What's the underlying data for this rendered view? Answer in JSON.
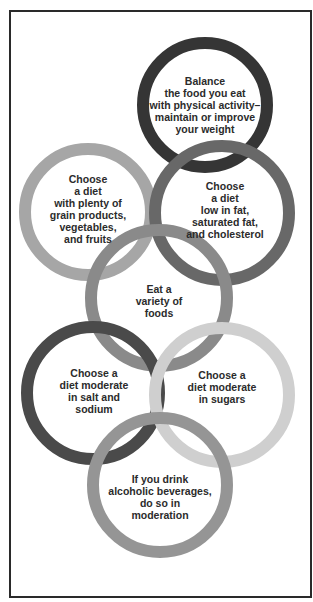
{
  "diagram": {
    "type": "interlocking-rings",
    "frame_color": "#2a2a2a",
    "rings": [
      {
        "id": "balance",
        "text": "Balance\nthe food you eat\nwith physical activity–\nmaintain or improve\nyour weight",
        "color": "#353535",
        "cx": 205,
        "cy": 105,
        "r": 62
      },
      {
        "id": "grain",
        "text": "Choose\na diet\nwith plenty of\ngrain products,\nvegetables,\nand fruits",
        "color": "#a6a6a6",
        "cx": 88,
        "cy": 212,
        "r": 63
      },
      {
        "id": "fat",
        "text": "Choose\na diet\nlow in fat,\nsaturated fat,\nand cholesterol",
        "color": "#686868",
        "cx": 222,
        "cy": 213,
        "r": 67
      },
      {
        "id": "variety",
        "text": "Eat a\nvariety of\nfoods",
        "color": "#8a8a8a",
        "cx": 159,
        "cy": 298,
        "r": 68
      },
      {
        "id": "salt",
        "text": "Choose a\ndiet moderate\nin salt and\nsodium",
        "color": "#4a4a4a",
        "cx": 93,
        "cy": 393,
        "r": 66
      },
      {
        "id": "sugars",
        "text": "Choose a\ndiet moderate\nin sugars",
        "color": "#cfcfcf",
        "cx": 222,
        "cy": 395,
        "r": 67
      },
      {
        "id": "alcohol",
        "text": "If you drink\nalcoholic beverages,\ndo so in\nmoderation",
        "color": "#959595",
        "cx": 160,
        "cy": 485,
        "r": 67
      }
    ],
    "ring_stroke_width": 12
  }
}
